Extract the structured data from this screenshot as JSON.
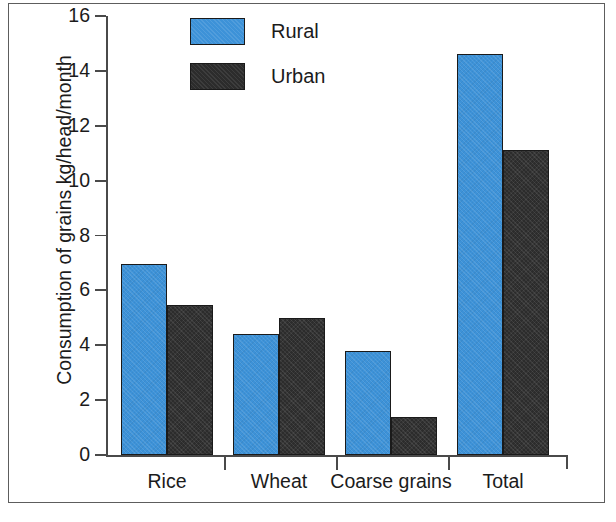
{
  "chart_data": {
    "type": "bar",
    "title": "",
    "xlabel": "",
    "ylabel": "Consumption of grains kg/head/month",
    "categories": [
      "Rice",
      "Wheat",
      "Coarse grains",
      "Total"
    ],
    "series": [
      {
        "name": "Rural",
        "color": "#3d92d8",
        "values": [
          6.95,
          4.4,
          3.8,
          14.6
        ]
      },
      {
        "name": "Urban",
        "color": "#2c2c2c",
        "values": [
          5.45,
          5.0,
          1.4,
          11.1
        ]
      }
    ],
    "ylim": [
      0,
      16
    ],
    "ytick_labels": [
      "0",
      "2",
      "4",
      "6",
      "8",
      "10",
      "12",
      "14",
      "16"
    ],
    "ytick_values": [
      0,
      2,
      4,
      6,
      8,
      10,
      12,
      14,
      16
    ],
    "grid": false,
    "legend_position": "top-center",
    "legend_entries": [
      "Rural",
      "Urban"
    ]
  },
  "figure": {
    "frame_color": "#5d5d5d",
    "background": "#ffffff",
    "axis_color": "#4a4a4a",
    "text_color": "#1b1b1b"
  }
}
